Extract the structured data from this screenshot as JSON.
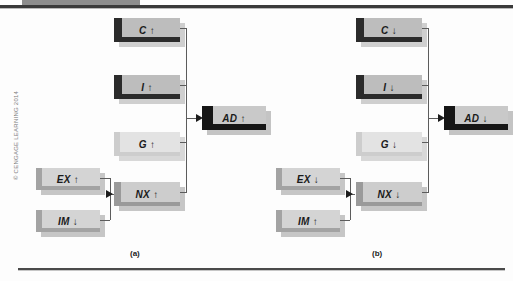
{
  "figure": {
    "copyright": "© CENGAGE LEARNING 2014",
    "panels": [
      {
        "id": "a",
        "caption": "(a)"
      },
      {
        "id": "b",
        "caption": "(b)"
      }
    ]
  },
  "colors": {
    "box_dark_face": "#bdbdbd",
    "box_light_face": "#e3e3e3",
    "box_mid_face": "#c9c9c9",
    "box_edge_dark": "#2b2b2b",
    "box_edge_mid": "#8f8f8f",
    "connector": "#5c5c5c",
    "arrow": "#1c1c1c",
    "rule": "#3a3a3a",
    "top_tab": "#8d8d8d",
    "copyright_text": "#7c7c7c"
  },
  "panel_a": {
    "caption": "(a)",
    "nodes": {
      "c": {
        "label": "C ↑",
        "variable": "C",
        "direction": "up"
      },
      "i": {
        "label": "I ↑",
        "variable": "I",
        "direction": "up"
      },
      "g": {
        "label": "G ↑",
        "variable": "G",
        "direction": "up"
      },
      "nx": {
        "label": "NX ↑",
        "variable": "NX",
        "direction": "up"
      },
      "ex": {
        "label": "EX ↑",
        "variable": "EX",
        "direction": "up"
      },
      "im": {
        "label": "IM ↓",
        "variable": "IM",
        "direction": "down"
      },
      "ad": {
        "label": "AD ↑",
        "variable": "AD",
        "direction": "up"
      }
    }
  },
  "panel_b": {
    "caption": "(b)",
    "nodes": {
      "c": {
        "label": "C ↓",
        "variable": "C",
        "direction": "down"
      },
      "i": {
        "label": "I ↓",
        "variable": "I",
        "direction": "down"
      },
      "g": {
        "label": "G ↓",
        "variable": "G",
        "direction": "down"
      },
      "nx": {
        "label": "NX ↓",
        "variable": "NX",
        "direction": "down"
      },
      "ex": {
        "label": "EX ↓",
        "variable": "EX",
        "direction": "down"
      },
      "im": {
        "label": "IM ↑",
        "variable": "IM",
        "direction": "up"
      },
      "ad": {
        "label": "AD ↓",
        "variable": "AD",
        "direction": "down"
      }
    }
  }
}
